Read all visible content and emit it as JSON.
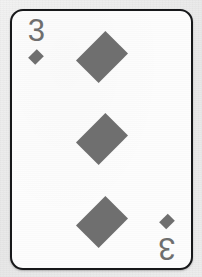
{
  "card": {
    "rank": "3",
    "suit": "diamonds",
    "suit_symbol": "diamond",
    "name": "Three of Diamonds",
    "corner_indices": [
      {
        "position": "top-left",
        "rank": "3",
        "pip": "diamond-pip"
      },
      {
        "position": "bottom-right",
        "rank": "3",
        "pip": "diamond-pip"
      }
    ],
    "center_pips": [
      {
        "position": "top",
        "pip": "diamond-pip"
      },
      {
        "position": "middle",
        "pip": "diamond-pip"
      },
      {
        "position": "bottom",
        "pip": "diamond-pip"
      }
    ],
    "pip_count": 3,
    "colors": {
      "card_face": "#fdfdfd",
      "card_border": "#17181a",
      "pip": "#6f6f6f",
      "rank_text": "#6e6e6e",
      "backdrop": "#ededed"
    },
    "geometry": {
      "corner_radius_px": 13,
      "border_width_px": 2,
      "card_width_px": 183,
      "card_height_px": 261
    }
  }
}
